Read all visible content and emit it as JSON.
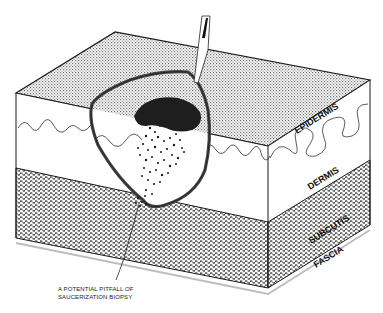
{
  "figure": {
    "type": "anatomical-diagram"
  },
  "layers": [
    {
      "id": "epidermis",
      "label": "EPIDERMIS"
    },
    {
      "id": "dermis",
      "label": "DERMIS"
    },
    {
      "id": "subcutis",
      "label": "SUBCUTIS"
    },
    {
      "id": "fascia",
      "label": "FASCIA"
    }
  ],
  "annotation": {
    "line1": "A POTENTIAL PITFALL OF",
    "line2": "SAUCERIZATION BIOPSY"
  },
  "colors": {
    "outline": "#1a1a1a",
    "surface_stipple": "#9a9a9a",
    "lesion": "#1e1e1e",
    "subcutis_hatch": "#333333",
    "background": "#ffffff"
  }
}
